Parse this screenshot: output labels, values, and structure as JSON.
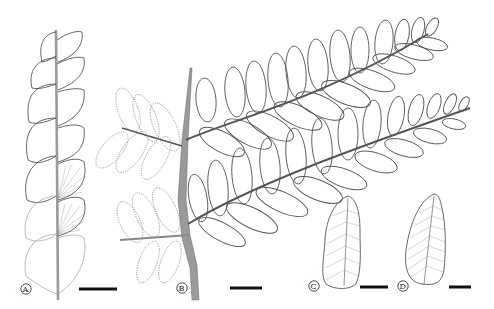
{
  "figure": {
    "panels": [
      {
        "id": "A",
        "label": "A",
        "description": "simple pinnate segment with leaflets along grey rachis, two leaflets showing venation"
      },
      {
        "id": "B",
        "label": "B",
        "description": "frond with grey stipe bearing four pinnae; left pinnae dotted (reconstructed), right pinnae solid"
      },
      {
        "id": "C",
        "label": "C",
        "description": "single pinnule with venation"
      },
      {
        "id": "D",
        "label": "D",
        "description": "single pinnule with dense venation"
      }
    ],
    "scale_bars": [
      {
        "panel": "A",
        "x1": 79,
        "x2": 117,
        "y": 289
      },
      {
        "panel": "B",
        "x1": 230,
        "x2": 262,
        "y": 288
      },
      {
        "panel": "C",
        "x1": 360,
        "x2": 388,
        "y": 287
      },
      {
        "panel": "D",
        "x1": 449,
        "x2": 471,
        "y": 287
      }
    ],
    "colors": {
      "stipe": "#9a9a9a",
      "outline": "#555555",
      "dotted": "#8a8a8a",
      "scale_bar": "#111111"
    }
  }
}
